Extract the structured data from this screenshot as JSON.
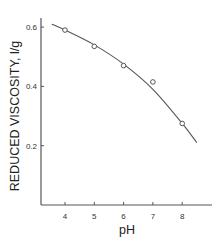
{
  "chart_data": {
    "type": "scatter",
    "title": "",
    "xlabel": "pH",
    "ylabel": "REDUCED VISCOSITY, l/g",
    "xlim": [
      3.2,
      9.0
    ],
    "ylim": [
      0.0,
      0.65
    ],
    "x_ticks": [
      4,
      5,
      6,
      7,
      8
    ],
    "x_tick_labels": [
      "4",
      "5",
      "6",
      "7",
      "8"
    ],
    "y_ticks": [
      0.2,
      0.4,
      0.6
    ],
    "y_tick_labels": [
      "0.2",
      "0.4",
      "0.6"
    ],
    "grid": false,
    "legend": null,
    "series": [
      {
        "name": "measured",
        "marker": "open-circle",
        "x": [
          4,
          5,
          6,
          7,
          8
        ],
        "y": [
          0.59,
          0.535,
          0.47,
          0.415,
          0.275
        ]
      },
      {
        "name": "fitted curve",
        "style": "line",
        "x": [
          3.55,
          4,
          5,
          6,
          7,
          8,
          8.5
        ],
        "y": [
          0.61,
          0.59,
          0.54,
          0.475,
          0.39,
          0.275,
          0.21
        ]
      }
    ]
  },
  "colors": {
    "line": "#555555",
    "axis": "#555555",
    "marker": "#555555",
    "background": "#ffffff"
  }
}
